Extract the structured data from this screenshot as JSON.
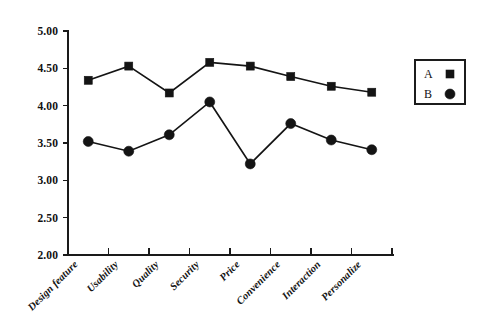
{
  "chart_data": {
    "type": "line",
    "title": "",
    "subtitle": "",
    "xlabel": "",
    "ylabel": "",
    "ylim": [
      2.0,
      5.0
    ],
    "ytick_step": 0.5,
    "grid": false,
    "legend_position": "right",
    "categories": [
      "Design feature",
      "Usability",
      "Quality",
      "Security",
      "Price",
      "Convenience",
      "Interaction",
      "Personalize"
    ],
    "ytick_labels": [
      "5.00",
      "4.50",
      "4.00",
      "3.50",
      "3.00",
      "2.50",
      "2.00"
    ],
    "ytick_values": [
      5.0,
      4.5,
      4.0,
      3.5,
      3.0,
      2.5,
      2.0
    ],
    "series": [
      {
        "name": "A",
        "marker": "square",
        "color": "#141414",
        "values": [
          4.34,
          4.53,
          4.17,
          4.58,
          4.53,
          4.39,
          4.26,
          4.18
        ]
      },
      {
        "name": "B",
        "marker": "circle",
        "color": "#141414",
        "values": [
          3.52,
          3.39,
          3.61,
          4.05,
          3.22,
          3.76,
          3.54,
          3.41
        ]
      }
    ],
    "legend": [
      {
        "label": "A",
        "marker": "square"
      },
      {
        "label": "B",
        "marker": "circle"
      }
    ]
  },
  "colors": {
    "background": "#ffffff",
    "ink": "#141414",
    "axis": "#1a1a1a"
  }
}
